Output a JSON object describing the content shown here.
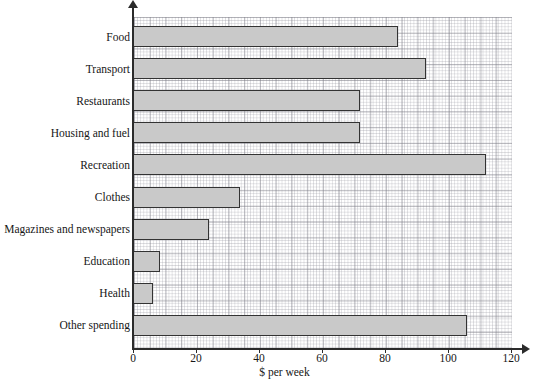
{
  "chart_data": {
    "type": "bar",
    "orientation": "horizontal",
    "title": "",
    "xlabel": "$ per week",
    "ylabel": "",
    "xlim": [
      0,
      120
    ],
    "xticks": [
      0,
      20,
      40,
      60,
      80,
      100,
      120
    ],
    "grid": true,
    "grid_style": "graph-paper",
    "legend": "none",
    "categories": [
      "Food",
      "Transport",
      "Restaurants",
      "Housing and fuel",
      "Recreation",
      "Clothes",
      "Magazines and newspapers",
      "Education",
      "Health",
      "Other spending"
    ],
    "values": [
      84,
      93,
      72,
      72,
      112,
      34,
      24,
      8.5,
      6.5,
      106
    ],
    "bar_fill_color": "#c9c9c9",
    "bar_edge_color": "#333333"
  },
  "axis": {
    "x_title": "$ per week",
    "tick_labels": [
      "0",
      "20",
      "40",
      "60",
      "80",
      "100",
      "120"
    ]
  }
}
